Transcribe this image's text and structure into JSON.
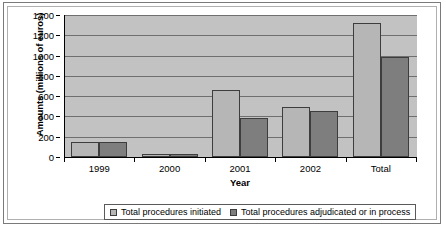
{
  "chart_data": {
    "type": "bar",
    "title": "",
    "xlabel": "Year",
    "ylabel": "Amounts (millions of euros)",
    "categories": [
      "1999",
      "2000",
      "2001",
      "2002",
      "Total"
    ],
    "series": [
      {
        "name": "Total procedures initiated",
        "color": "#b6b6b6",
        "values": [
          150,
          30,
          660,
          490,
          1320
        ]
      },
      {
        "name": "Total procedures adjudicated or in process",
        "color": "#7e7e7e",
        "values": [
          150,
          30,
          385,
          455,
          985
        ]
      }
    ],
    "ylim": [
      0,
      1400
    ],
    "ytick_step": 200,
    "yticks": [
      "1400",
      "1200",
      "1000",
      "800",
      "600",
      "400",
      "200",
      "0"
    ],
    "grid": true,
    "legend_position": "bottom",
    "plot_background": "#c2c2c2"
  },
  "legend": {
    "entries": [
      {
        "label": "Total procedures initiated"
      },
      {
        "label": "Total procedures adjudicated or in process"
      }
    ]
  }
}
